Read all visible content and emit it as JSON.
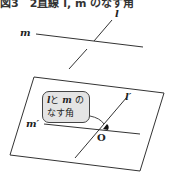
{
  "caption": "図3　2直線 l, m のなす角",
  "labels": {
    "line_l": "l",
    "line_m": "m",
    "line_l_prime": "l′",
    "line_m_prime": "m′",
    "origin": "O"
  },
  "callout": {
    "var_l": "l",
    "connector": "と",
    "var_m": "m",
    "suffix": "の",
    "line2": "なす角"
  },
  "colors": {
    "stroke": "#333333",
    "callout_fill": "#e4e4e4",
    "angle_mark": "#111111"
  }
}
